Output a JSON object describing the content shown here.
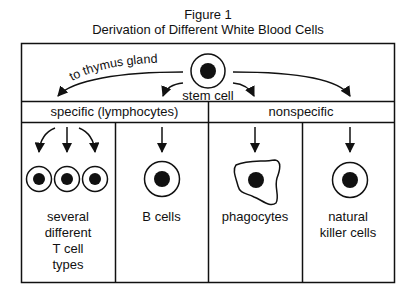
{
  "figure": {
    "label": "Figure 1",
    "title": "Derivation of Different White Blood Cells"
  },
  "diagram": {
    "origin": {
      "label": "stem cell",
      "arrow_label": "to thymus gland"
    },
    "categories": [
      {
        "label": "specific (lymphocytes)"
      },
      {
        "label": "nonspecific"
      }
    ],
    "cells": [
      {
        "label_lines": [
          "several",
          "different",
          "T cell",
          "types"
        ],
        "category": "specific (lymphocytes)"
      },
      {
        "label_lines": [
          "B cells"
        ],
        "category": "specific (lymphocytes)"
      },
      {
        "label_lines": [
          "phagocytes"
        ],
        "category": "nonspecific"
      },
      {
        "label_lines": [
          "natural",
          "killer cells"
        ],
        "category": "nonspecific"
      }
    ]
  },
  "colors": {
    "line": "#111111",
    "background": "#ffffff"
  }
}
